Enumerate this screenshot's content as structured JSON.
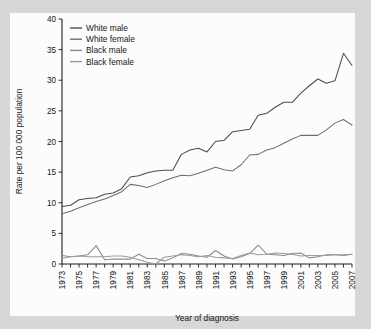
{
  "figure": {
    "background_color": "#d7d7d7",
    "panel_color": "#fcfcfc",
    "axis_color": "#1d1d1d"
  },
  "chart_data": {
    "type": "line",
    "title": "",
    "subtitle": "",
    "xlabel": "Year of diagnosis",
    "ylabel": "Rate per 100 000 population",
    "xlim": [
      1973,
      2007
    ],
    "ylim": [
      0,
      40
    ],
    "grid": false,
    "legend_position": "top-left",
    "x": [
      1973,
      1974,
      1975,
      1976,
      1977,
      1978,
      1979,
      1980,
      1981,
      1982,
      1983,
      1984,
      1985,
      1986,
      1987,
      1988,
      1989,
      1990,
      1991,
      1992,
      1993,
      1994,
      1995,
      1996,
      1997,
      1998,
      1999,
      2000,
      2001,
      2002,
      2003,
      2004,
      2005,
      2006,
      2007
    ],
    "xticks": [
      1973,
      1975,
      1977,
      1979,
      1981,
      1983,
      1985,
      1987,
      1989,
      1991,
      1993,
      1995,
      1997,
      1999,
      2001,
      2003,
      2005,
      2007
    ],
    "xticklabels": [
      "1973",
      "1975",
      "1977",
      "1979",
      "1981",
      "1983",
      "1985",
      "1987",
      "1989",
      "1991",
      "1993",
      "1995",
      "1997",
      "1999",
      "2001",
      "2003",
      "2005",
      "2007"
    ],
    "yticks": [
      0,
      5,
      10,
      15,
      20,
      25,
      30,
      35,
      40
    ],
    "yticklabels": [
      "0",
      "5",
      "10",
      "15",
      "20",
      "25",
      "30",
      "35",
      "40"
    ],
    "series": [
      {
        "name": "White male",
        "color": "#4d4d4d",
        "values": [
          9.4,
          9.6,
          10.5,
          10.7,
          10.8,
          11.4,
          11.6,
          12.3,
          14.2,
          14.4,
          14.9,
          15.2,
          15.3,
          15.3,
          17.9,
          18.6,
          18.9,
          18.3,
          20.0,
          20.2,
          21.6,
          21.8,
          22.0,
          24.3,
          24.6,
          25.6,
          26.4,
          26.4,
          27.9,
          29.1,
          30.2,
          29.5,
          29.9,
          34.4,
          32.4
        ]
      },
      {
        "name": "White female",
        "color": "#6f6f6f",
        "values": [
          8.2,
          8.6,
          9.2,
          9.7,
          10.2,
          10.6,
          11.2,
          11.8,
          13.0,
          12.8,
          12.5,
          13.0,
          13.6,
          14.1,
          14.5,
          14.4,
          14.8,
          15.3,
          15.8,
          15.4,
          15.2,
          16.2,
          17.8,
          17.9,
          18.6,
          19.0,
          19.7,
          20.4,
          21.0,
          21.0,
          21.0,
          21.9,
          23.0,
          23.6,
          22.7
        ]
      },
      {
        "name": "Black male",
        "color": "#8a8a8a",
        "values": [
          1.4,
          1.2,
          1.3,
          1.5,
          3.0,
          0.7,
          0.8,
          0.8,
          0.8,
          1.6,
          0.9,
          0.9,
          0.5,
          1.0,
          1.7,
          1.6,
          1.3,
          1.1,
          2.2,
          1.3,
          0.8,
          1.2,
          1.7,
          3.1,
          1.6,
          1.5,
          1.4,
          1.7,
          1.8,
          1.0,
          1.2,
          1.5,
          1.5,
          1.4,
          1.6
        ]
      },
      {
        "name": "Black female",
        "color": "#9c9c9c",
        "values": [
          0.9,
          1.2,
          1.3,
          1.2,
          1.2,
          1.2,
          1.3,
          1.3,
          1.1,
          0.7,
          0.3,
          0.0,
          1.1,
          1.3,
          1.5,
          1.4,
          1.2,
          1.4,
          1.1,
          1.0,
          0.9,
          1.4,
          1.8,
          1.5,
          1.6,
          1.8,
          1.7,
          1.6,
          1.3,
          1.4,
          1.4,
          1.4,
          1.5,
          1.5,
          1.6
        ]
      }
    ]
  },
  "legend": {
    "items": [
      {
        "label": "White male"
      },
      {
        "label": "White female"
      },
      {
        "label": "Black male"
      },
      {
        "label": "Black female"
      }
    ]
  }
}
